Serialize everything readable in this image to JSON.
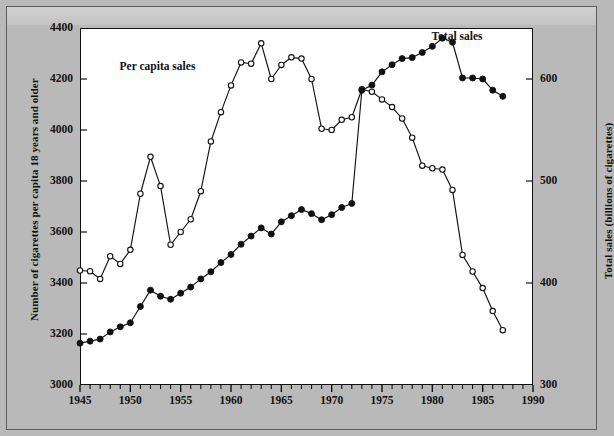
{
  "chart_data": {
    "type": "line",
    "title": "",
    "xlabel": "",
    "ylabel": "Number of cigarettes per capita  18 years and older",
    "ylabel_right": "Total sales (billions of cigarettes)",
    "xlim": [
      1945,
      1990
    ],
    "ylim": [
      3000,
      4400
    ],
    "ylim_right": [
      300,
      650
    ],
    "xticks": [
      1945,
      1950,
      1955,
      1960,
      1965,
      1970,
      1975,
      1980,
      1985,
      1990
    ],
    "xtick_labels": [
      "1945",
      "1950",
      "1955",
      "1960",
      "1965",
      "1970",
      "1975",
      "1980",
      "1985",
      "1990"
    ],
    "yticks": [
      3000,
      3200,
      3400,
      3600,
      3800,
      4000,
      4200,
      4400
    ],
    "ytick_labels": [
      "3000",
      "3200",
      "3400",
      "3600",
      "3800",
      "4000",
      "4200",
      "4400"
    ],
    "yticks_right": [
      300,
      400,
      500,
      600
    ],
    "ytick_labels_right": [
      "300",
      "400",
      "500",
      "600"
    ],
    "minor_xticks": true,
    "grid": false,
    "legend_position": "inline-annotations",
    "series": [
      {
        "name": "Per capita sales",
        "marker": "open-circle",
        "axis": "left",
        "label_x": 1953.5,
        "label_y": 4245,
        "x": [
          1945,
          1946,
          1947,
          1948,
          1949,
          1950,
          1951,
          1952,
          1953,
          1954,
          1955,
          1956,
          1957,
          1958,
          1959,
          1960,
          1961,
          1962,
          1963,
          1964,
          1965,
          1966,
          1967,
          1968,
          1969,
          1970,
          1971,
          1972,
          1973,
          1974,
          1975,
          1976,
          1977,
          1978,
          1979,
          1980,
          1981,
          1982,
          1983,
          1984,
          1985,
          1986,
          1987
        ],
        "values": [
          3449,
          3446,
          3416,
          3505,
          3475,
          3530,
          3750,
          3895,
          3780,
          3550,
          3600,
          3650,
          3760,
          3955,
          4070,
          4175,
          4265,
          4260,
          4340,
          4200,
          4255,
          4285,
          4280,
          4200,
          4005,
          4000,
          4040,
          4050,
          4160,
          4150,
          4120,
          4090,
          4045,
          3970,
          3860,
          3850,
          3845,
          3765,
          3510,
          3445,
          3380,
          3290,
          3215
        ]
      },
      {
        "name": "Total sales",
        "marker": "filled-circle",
        "axis": "right",
        "label_x": 1982.5,
        "label_y": 640,
        "x": [
          1945,
          1946,
          1947,
          1948,
          1949,
          1950,
          1951,
          1952,
          1953,
          1954,
          1955,
          1956,
          1957,
          1958,
          1959,
          1960,
          1961,
          1962,
          1963,
          1964,
          1965,
          1966,
          1967,
          1968,
          1969,
          1970,
          1971,
          1972,
          1973,
          1974,
          1975,
          1976,
          1977,
          1978,
          1979,
          1980,
          1981,
          1982,
          1983,
          1984,
          1985,
          1986,
          1987
        ],
        "values": [
          341,
          343,
          345,
          352,
          357,
          361,
          377,
          393,
          387,
          384,
          390,
          396,
          404,
          411,
          420,
          428,
          438,
          446,
          454,
          448,
          460,
          466,
          472,
          468,
          462,
          467,
          474,
          478,
          589,
          594,
          607,
          614,
          620,
          621,
          626,
          632,
          640,
          636,
          601,
          601,
          600,
          589,
          583
        ]
      }
    ],
    "annotations": [
      {
        "text": "Per capita sales",
        "x": 1953.5,
        "y_left": 4245
      },
      {
        "text": "Total sales",
        "x": 1982.5,
        "y_right": 640
      }
    ]
  },
  "axes": {
    "left_title": "Number of cigarettes per capita  18 years and older",
    "right_title": "Total sales (billions of cigarettes)"
  },
  "annotations": {
    "per_capita_label": "Per capita sales",
    "total_label": "Total sales"
  },
  "colors": {
    "background": "#b9b9b9",
    "plot_background": "#ffffff",
    "line": "#111111",
    "frame": "#111111"
  }
}
